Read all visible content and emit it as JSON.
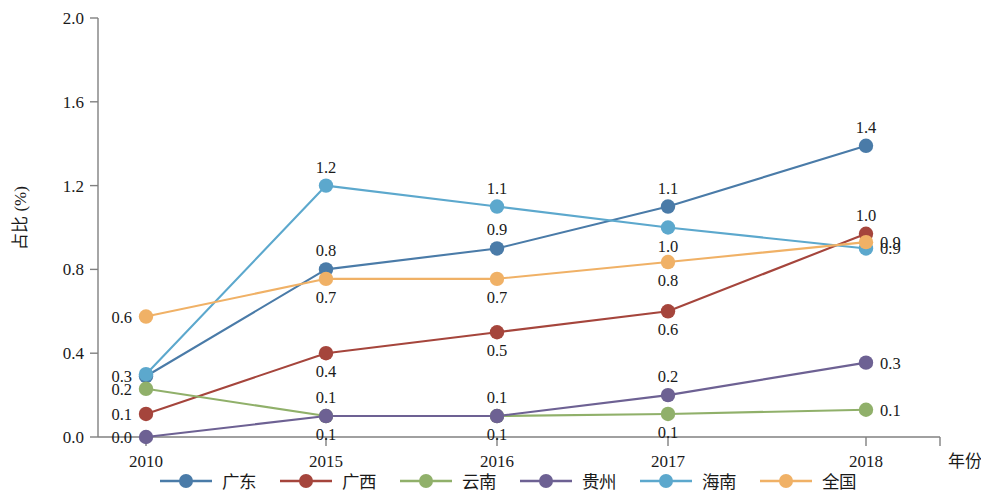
{
  "chart_data": {
    "type": "line",
    "title": "",
    "xlabel": "年份",
    "ylabel": "占比 (%)",
    "categories": [
      "2010",
      "2015",
      "2016",
      "2017",
      "2018"
    ],
    "x_tick_labels": [
      "2010",
      "2015",
      "2016",
      "2017",
      "2018"
    ],
    "y_tick_labels": [
      "0.0",
      "0.4",
      "0.8",
      "1.2",
      "1.6",
      "2.0"
    ],
    "y_ticks": [
      0.0,
      0.4,
      0.8,
      1.2,
      1.6,
      2.0
    ],
    "ylim": [
      0.0,
      2.0
    ],
    "grid": false,
    "legend_position": "bottom",
    "series": [
      {
        "name": "广东",
        "color": "#4a7ba8",
        "values": [
          0.29,
          0.8,
          0.9,
          1.1,
          1.39
        ],
        "labels": [
          "0.3",
          "0.8",
          "0.9",
          "1.1",
          "1.4"
        ],
        "label_positions": [
          "left",
          "above",
          "above",
          "above",
          "above"
        ]
      },
      {
        "name": "广西",
        "color": "#a5453c",
        "values": [
          0.11,
          0.4,
          0.5,
          0.6,
          0.97
        ],
        "labels": [
          "0.1",
          "0.4",
          "0.5",
          "0.6",
          "1.0"
        ],
        "label_positions": [
          "left",
          "below",
          "below",
          "below",
          "above"
        ]
      },
      {
        "name": "云南",
        "color": "#90b06a",
        "values": [
          0.23,
          0.1,
          0.1,
          0.11,
          0.13
        ],
        "labels": [
          "0.2",
          "0.1",
          "0.1",
          "0.1",
          "0.1"
        ],
        "label_positions": [
          "left",
          "above",
          "above",
          "below",
          "right"
        ]
      },
      {
        "name": "贵州",
        "color": "#6d6193",
        "values": [
          0.0,
          0.1,
          0.1,
          0.2,
          0.355
        ],
        "labels": [
          "0.0",
          "0.1",
          "0.1",
          "0.2",
          "0.3"
        ],
        "label_positions": [
          "left",
          "below",
          "below",
          "above",
          "right"
        ]
      },
      {
        "name": "海南",
        "color": "#5ca8cd",
        "values": [
          0.3,
          1.2,
          1.1,
          1.0,
          0.9
        ],
        "labels": [
          "0.3",
          "1.2",
          "1.1",
          "1.0",
          "0.9"
        ],
        "label_positions": [
          "hidden",
          "above",
          "above",
          "below",
          "right"
        ]
      },
      {
        "name": "全国",
        "color": "#f0b166",
        "values": [
          0.575,
          0.755,
          0.755,
          0.835,
          0.93
        ],
        "labels": [
          "0.6",
          "0.7",
          "0.7",
          "0.8",
          "0.9"
        ],
        "label_positions": [
          "left",
          "below",
          "below",
          "below",
          "right"
        ]
      }
    ]
  },
  "legend": {
    "items": [
      {
        "label": "广东",
        "color": "#4a7ba8"
      },
      {
        "label": "广西",
        "color": "#a5453c"
      },
      {
        "label": "云南",
        "color": "#90b06a"
      },
      {
        "label": "贵州",
        "color": "#6d6193"
      },
      {
        "label": "海南",
        "color": "#5ca8cd"
      },
      {
        "label": "全国",
        "color": "#f0b166"
      }
    ]
  },
  "axis": {
    "y_label": "占比 (%)",
    "x_label": "年份",
    "y_ticks": [
      "2.0",
      "1.6",
      "1.2",
      "0.8",
      "0.4",
      "0.0"
    ],
    "x_ticks": [
      "2010",
      "2015",
      "2016",
      "2017",
      "2018"
    ]
  }
}
